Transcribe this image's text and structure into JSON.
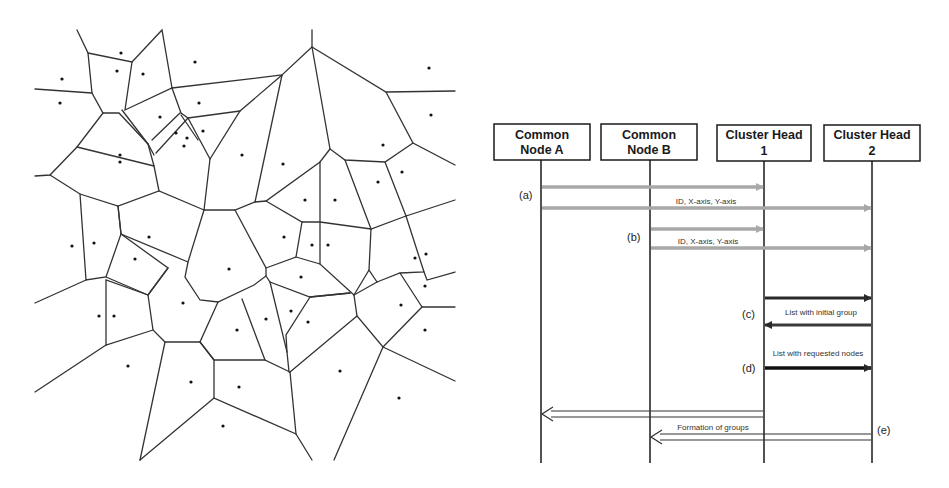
{
  "figure": {
    "left_panel": {
      "title": "Voronoi partition of nodes",
      "edge_color": "#333333",
      "point_color": "#111111"
    },
    "right_panel": {
      "participants": [
        {
          "id": "A",
          "line1": "Common",
          "line2": "Node A"
        },
        {
          "id": "B",
          "line1": "Common",
          "line2": "Node B"
        },
        {
          "id": "CH1",
          "line1": "Cluster Head",
          "line2": "1"
        },
        {
          "id": "CH2",
          "line1": "Cluster Head",
          "line2": "2"
        }
      ],
      "steps": {
        "a": "(a)",
        "b": "(b)",
        "c": "(c)",
        "d": "(d)",
        "e": "(e)"
      },
      "messages": {
        "a_label": "ID,  X-axis, Y-axis",
        "b_label": "ID,  X-axis, Y-axis",
        "c_label": "List with initial group",
        "d_label": "List with requested nodes",
        "e_label": "Formation of groups"
      },
      "colors": {
        "gray_arrow": "#a8a8a8",
        "dark_arrow": "#2a2a2a",
        "line": "#1a1a1a"
      }
    }
  }
}
